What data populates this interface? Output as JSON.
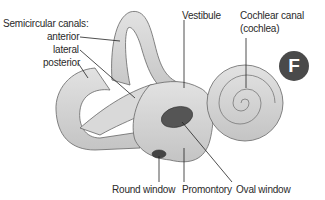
{
  "diagram": {
    "title_badge": "F",
    "labels": {
      "semicircular_canals": "Semicircular canals:",
      "anterior": "anterior",
      "lateral": "lateral",
      "posterior": "posterior",
      "vestibule": "Vestibule",
      "cochlear_canal": "Cochlear canal",
      "cochlea": "(cochlea)",
      "round_window": "Round window",
      "promontory": "Promontory",
      "oval_window": "Oval window"
    },
    "colors": {
      "structure_fill": "#d4d4d4",
      "structure_outline": "#555555",
      "window_fill": "#555555",
      "badge": "#4a4a4a",
      "leader_line": "#222222"
    }
  }
}
